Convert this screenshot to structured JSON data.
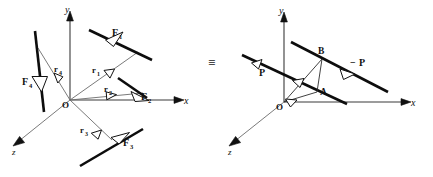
{
  "figure": {
    "equivalence_symbol": "≡",
    "background_color": "#ffffff",
    "ink_color": "#111111",
    "thin_line_color": "#6b6b6b",
    "left_diagram": {
      "name": "original-force-system",
      "axes": [
        {
          "id": "y",
          "label": "y",
          "direction": "up"
        },
        {
          "id": "x",
          "label": "x",
          "direction": "right"
        },
        {
          "id": "z",
          "label": "z",
          "direction": "down-left"
        }
      ],
      "origin_label": "O",
      "forces": [
        {
          "id": "F1",
          "label": "F",
          "subscript": "1",
          "arrow_style": "open-triangle"
        },
        {
          "id": "F2",
          "label": "F",
          "subscript": "2",
          "arrow_style": "open-triangle"
        },
        {
          "id": "F3",
          "label": "F",
          "subscript": "3",
          "arrow_style": "open-triangle"
        },
        {
          "id": "F4",
          "label": "F",
          "subscript": "4",
          "arrow_style": "open-triangle"
        }
      ],
      "position_vectors": [
        {
          "id": "r1",
          "label": "r",
          "subscript": "1",
          "arrow_style": "open-triangle"
        },
        {
          "id": "r2",
          "label": "r",
          "subscript": "2",
          "arrow_style": "open-triangle"
        },
        {
          "id": "r3",
          "label": "r",
          "subscript": "3",
          "arrow_style": "open-triangle"
        },
        {
          "id": "r4",
          "label": "r",
          "subscript": "4",
          "arrow_style": "open-triangle"
        }
      ]
    },
    "right_diagram": {
      "name": "equivalent-couple-system",
      "axes": [
        {
          "id": "y",
          "label": "y",
          "direction": "up"
        },
        {
          "id": "x",
          "label": "x",
          "direction": "right"
        },
        {
          "id": "z",
          "label": "z",
          "direction": "down-left"
        }
      ],
      "origin_label": "O",
      "points": [
        {
          "id": "A",
          "label": "A"
        },
        {
          "id": "B",
          "label": "B"
        }
      ],
      "forces": [
        {
          "id": "P",
          "label": "P",
          "sign": "",
          "arrow_style": "open-triangle"
        },
        {
          "id": "minus-P",
          "label": "P",
          "sign": "−",
          "arrow_style": "open-triangle"
        }
      ]
    }
  }
}
